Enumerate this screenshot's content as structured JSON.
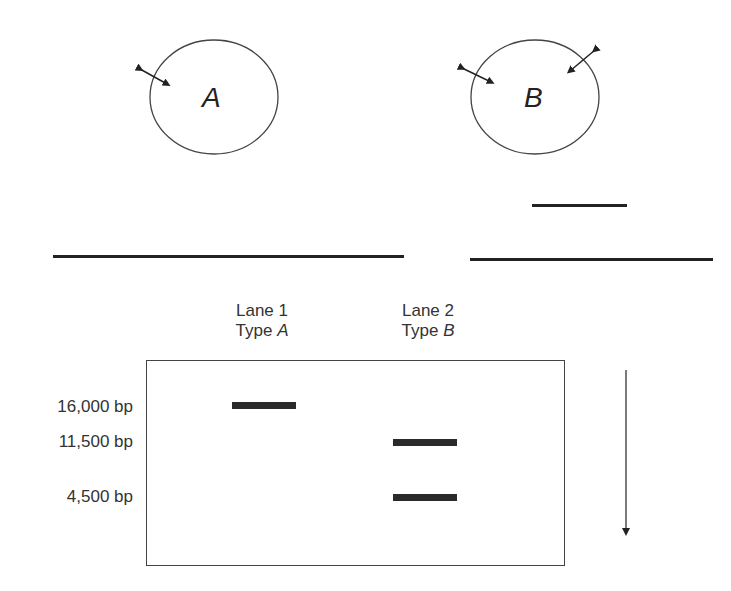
{
  "plasmids": [
    {
      "name": "A",
      "cut_sites": 1
    },
    {
      "name": "B",
      "cut_sites": 2
    }
  ],
  "gel": {
    "lanes": [
      {
        "line1": "Lane 1",
        "line2_prefix": "Type ",
        "line2_italic": "A"
      },
      {
        "line1": "Lane 2",
        "line2_prefix": "Type ",
        "line2_italic": "B"
      }
    ],
    "size_markers": [
      "16,000 bp",
      "11,500 bp",
      "4,500 bp"
    ],
    "bands": [
      {
        "lane": 1,
        "size": "16,000 bp"
      },
      {
        "lane": 2,
        "size": "11,500 bp"
      },
      {
        "lane": 2,
        "size": "4,500 bp"
      }
    ],
    "migration_direction": "down"
  },
  "colors": {
    "ink": "#222222",
    "outline": "#444444",
    "background": "#ffffff"
  }
}
